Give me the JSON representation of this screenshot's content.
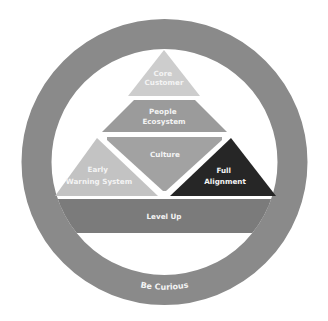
{
  "diagram": {
    "title": "",
    "ring": {
      "label": "Be Curious",
      "color": "#8a8a8a"
    },
    "blocks": [
      {
        "id": "core-customer",
        "lines": [
          "Core",
          "Customer"
        ],
        "color": "#cdcdcd",
        "shape": "triangle"
      },
      {
        "id": "people-ecosystem",
        "lines": [
          "People",
          "Ecosystem"
        ],
        "color": "#9b9b9b",
        "shape": "trapezoid"
      },
      {
        "id": "culture",
        "lines": [
          "Culture"
        ],
        "color": "#a2a2a2",
        "shape": "inverted-triangle"
      },
      {
        "id": "early-warning-system",
        "lines": [
          "Early",
          "Warning System"
        ],
        "color": "#c3c3c3",
        "shape": "triangle"
      },
      {
        "id": "full-alignment",
        "lines": [
          "Full",
          "Alignment"
        ],
        "color": "#262626",
        "shape": "triangle"
      },
      {
        "id": "level-up",
        "lines": [
          "Level Up"
        ],
        "color": "#7b7b7b",
        "shape": "bar"
      }
    ]
  }
}
